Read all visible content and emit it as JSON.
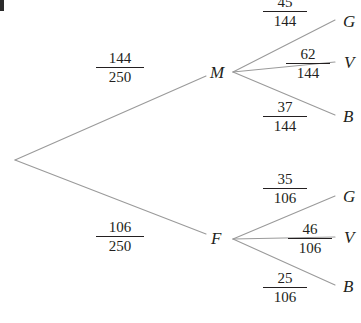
{
  "diagram": {
    "type": "probability-tree",
    "line_color": "#9a9a9a",
    "text_color": "#231f20",
    "background": "#ffffff",
    "root": {
      "label": ""
    },
    "stage1": [
      {
        "node": "M",
        "probability_numerator": "144",
        "probability_denominator": "250",
        "branches": [
          {
            "leaf": "G",
            "numerator": "45",
            "denominator": "144"
          },
          {
            "leaf": "V",
            "numerator": "62",
            "denominator": "144"
          },
          {
            "leaf": "B",
            "numerator": "37",
            "denominator": "144"
          }
        ]
      },
      {
        "node": "F",
        "probability_numerator": "106",
        "probability_denominator": "250",
        "branches": [
          {
            "leaf": "G",
            "numerator": "35",
            "denominator": "106"
          },
          {
            "leaf": "V",
            "numerator": "46",
            "denominator": "106"
          },
          {
            "leaf": "B",
            "numerator": "25",
            "denominator": "106"
          }
        ]
      }
    ]
  }
}
